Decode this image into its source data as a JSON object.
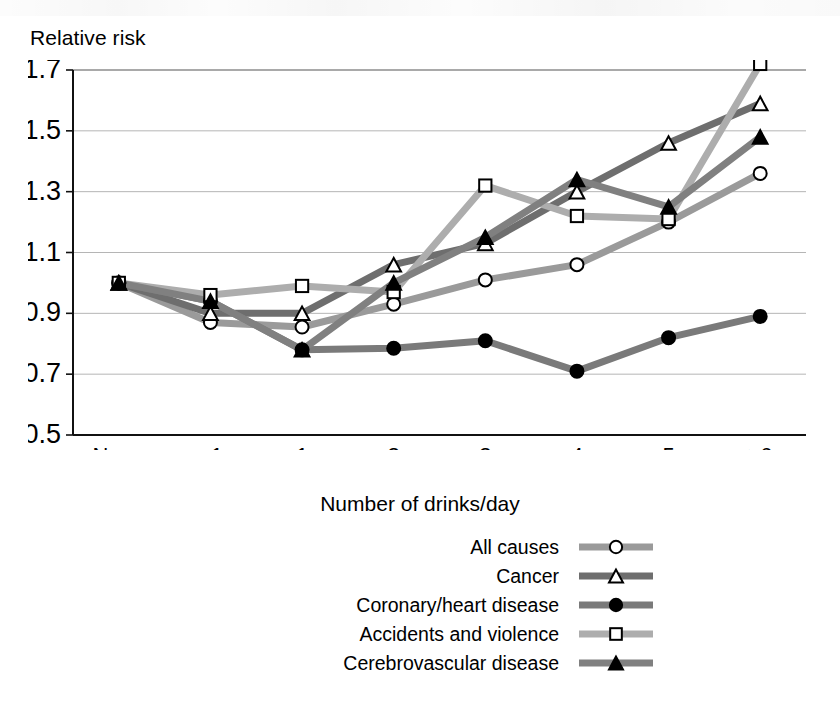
{
  "chart_data": {
    "type": "line",
    "title": "",
    "ylabel": "Relative risk",
    "xlabel": "Number of drinks/day",
    "categories": [
      "None",
      "<1",
      "1",
      "2",
      "3",
      "4",
      "5",
      "≥6"
    ],
    "ylim": [
      0.5,
      1.7
    ],
    "ytick_step": 0.2,
    "yticks": [
      "1.7",
      "1.5",
      "1.3",
      "1.1",
      "0.9",
      "0.7",
      "0.5"
    ],
    "ytick_values": [
      1.7,
      1.5,
      1.3,
      1.1,
      0.9,
      0.7,
      0.5
    ],
    "grid": "horizontal",
    "legend_position": "below",
    "series": [
      {
        "name": "All causes",
        "marker": "open-circle",
        "color": "#9a9a9a",
        "values": [
          1.0,
          0.87,
          0.855,
          0.93,
          1.01,
          1.06,
          1.2,
          1.36
        ]
      },
      {
        "name": "Cancer",
        "marker": "open-triangle",
        "color": "#6e6e6e",
        "values": [
          1.0,
          0.9,
          0.9,
          1.06,
          1.13,
          1.3,
          1.46,
          1.59
        ]
      },
      {
        "name": "Coronary/heart disease",
        "marker": "filled-circle",
        "color": "#7a7a7a",
        "values": [
          1.0,
          0.94,
          0.78,
          0.785,
          0.81,
          0.71,
          0.82,
          0.89
        ]
      },
      {
        "name": "Accidents and violence",
        "marker": "open-square",
        "color": "#adadad",
        "values": [
          1.0,
          0.96,
          0.99,
          0.97,
          1.32,
          1.22,
          1.21,
          1.72
        ]
      },
      {
        "name": "Cerebrovascular disease",
        "marker": "filled-triangle",
        "color": "#808080",
        "values": [
          1.0,
          0.94,
          0.78,
          1.0,
          1.15,
          1.34,
          1.25,
          1.48
        ]
      }
    ]
  },
  "axes": {
    "y_title": "Relative risk",
    "x_title": "Number of drinks/day"
  }
}
